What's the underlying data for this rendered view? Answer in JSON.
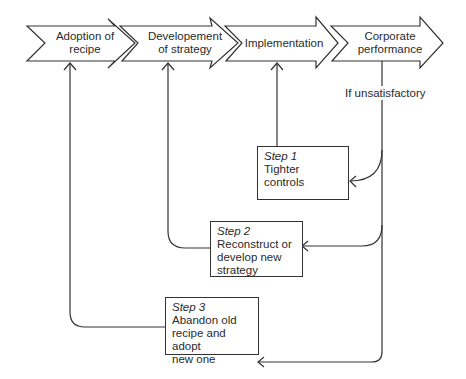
{
  "stages": [
    {
      "id": "adoption",
      "label_line1": "Adoption of",
      "label_line2": "recipe"
    },
    {
      "id": "development",
      "label_line1": "Developement",
      "label_line2": "of strategy"
    },
    {
      "id": "implementation",
      "label_line1": "Implementation",
      "label_line2": ""
    },
    {
      "id": "corporate",
      "label_line1": "Corporate",
      "label_line2": "performance"
    }
  ],
  "condition_label": "If unsatisfactory",
  "steps": [
    {
      "step": "Step 1",
      "lines": [
        "Tighter",
        "controls"
      ]
    },
    {
      "step": "Step 2",
      "lines": [
        "Reconstruct or",
        "develop new",
        "strategy"
      ]
    },
    {
      "step": "Step 3",
      "lines": [
        "Abandon old",
        "recipe and adopt",
        "new one"
      ]
    }
  ],
  "colors": {
    "line": "#333333",
    "background": "#ffffff"
  }
}
